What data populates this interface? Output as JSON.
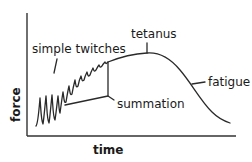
{
  "diagram": {
    "axes": {
      "x_label": "time",
      "y_label": "force"
    },
    "labels": {
      "simple_twitches": "simple twitches",
      "summation": "summation",
      "tetanus": "tetanus",
      "fatigue": "fatigue"
    },
    "colors": {
      "line": "#2a2a2a",
      "text": "#1a1a1a",
      "background": "#ffffff"
    }
  }
}
